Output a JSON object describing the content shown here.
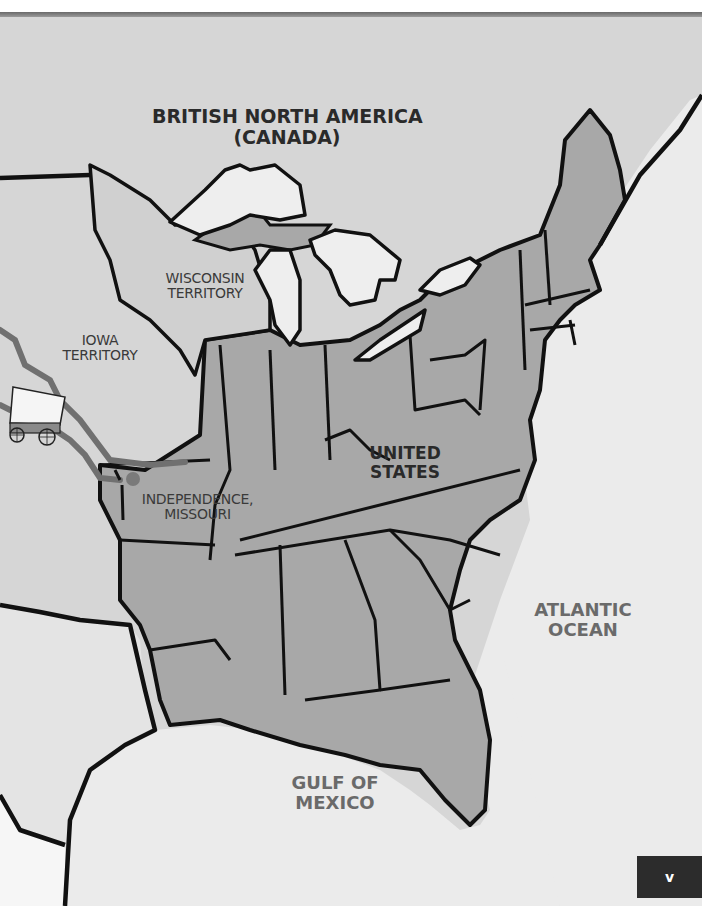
{
  "map": {
    "title_region": "BRITISH NORTH AMERICA",
    "title_region_sub": "(CANADA)",
    "labels": {
      "wisconsin_line1": "WISCONSIN",
      "wisconsin_line2": "TERRITORY",
      "iowa_line1": "IOWA",
      "iowa_line2": "TERRITORY",
      "us_line1": "UNITED",
      "us_line2": "STATES",
      "independence_line1": "INDEPENDENCE,",
      "independence_line2": "MISSOURI",
      "atlantic_line1": "ATLANTIC",
      "atlantic_line2": "OCEAN",
      "gulf_line1": "GULF OF",
      "gulf_line2": "MEXICO"
    },
    "icons": {
      "wagon": "covered-wagon-icon",
      "city_marker": "city-dot-icon"
    },
    "colors": {
      "canada": "#d6d6d6",
      "territory": "#d0d0d0",
      "states": "#a8a8a8",
      "water": "#ebebeb",
      "lakes": "#eeeeee",
      "borders": "#111111",
      "trail": "#707070",
      "water_label": "#6a6a6a"
    }
  },
  "page": {
    "number": "v"
  }
}
